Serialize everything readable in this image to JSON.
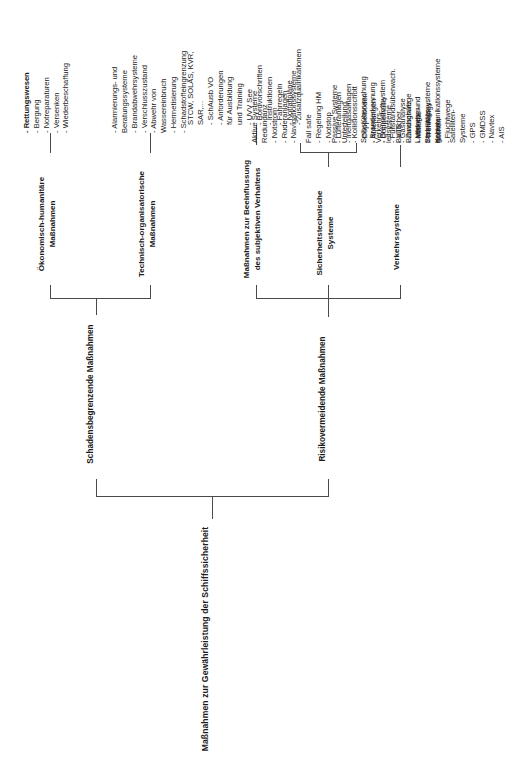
{
  "diagram": {
    "title": "Maßnahmen zur Gewährleistung der Schiffssicherheit",
    "branches": [
      {
        "id": "risiko",
        "label": "Risikovermeidende Maßnahmen"
      },
      {
        "id": "schaden",
        "label": "Schadensbegrenzende Maßnahmen"
      }
    ],
    "categories": [
      {
        "id": "verkehrssysteme",
        "label": "Verkehrssysteme"
      },
      {
        "id": "sicherheitstechnik",
        "label": "Sicherheitstechnische\nSysteme"
      },
      {
        "id": "verhalten",
        "label": "Maßnahmen zur Beeinflussung\ndes subjektiven Verhaltens"
      },
      {
        "id": "techorg",
        "label": "Technisch-organisatorische\nMaßnahmen"
      },
      {
        "id": "oekonomisch",
        "label": "Ökonomisch-humanitäre\nMaßnahmen"
      }
    ],
    "columns": [
      {
        "id": "col-verkehrssysteme",
        "groups": [
          {
            "heading": "Verkehrs-\nleitsysteme",
            "items": [
              "- VTS",
              "- Zwangswege",
              "- Verkehrs-\n  trennungs-\n  gebiete"
            ]
          },
          {
            "heading": "Satelliten-\nSysteme",
            "items": [
              "- GPS",
              "- GMDSS",
              "- Navtex",
              "- AIS"
            ]
          }
        ]
      },
      {
        "id": "col-sicherheitstechnik-passiv",
        "groups": [
          {
            "heading": "Passive Systeme\nUnterteilung",
            "items": [
              "- Kollisionsschott",
              "- Doppelboden",
              "- Abteilungen",
              "- Doppelhülle"
            ]
          },
          {
            "heading": "Baulicher\nBrandschutz",
            "items": [
              "- Material",
              "- Trennungs-\n  flächen",
              "- Fluchtwege"
            ]
          }
        ]
      },
      {
        "id": "col-sicherheitstechnik-aktiv",
        "groups": [
          {
            "heading": "Aktive Systeme\nRedundanz",
            "items": [
              "- Notstrom",
              "- Ruderanlagen",
              "- Navigationssysteme"
            ]
          },
          {
            "heading": "Fail safe",
            "items": [
              "- Regelung HM",
              "- Notstop",
              "- Lüfteranlagen",
              "- Inertgasanlagen"
            ]
          },
          {
            "heading": "Selbstüberwachung",
            "items": [
              "- Branderkennung",
              "- Brennstoffsystem",
              "- Füllstandsüberwach.",
              "- Gasanalyse"
            ]
          },
          {
            "heading": "Ladungs- und\nStabilitätssysteme\nKommunikationssysteme",
            "items": []
          }
        ]
      },
      {
        "id": "col-verhalten",
        "groups": [
          {
            "heading": "STCW, SOLAS, KVR,\nSAR,...",
            "items": [
              "- SchAusb VO",
              "- Anforderungen\n  für Ausbildung\n  und Training",
              "- UVV See",
              "- Bordvorschriften",
              "- Instruktionen",
              "- Fahrregeln",
              "- Notfallpläne",
              "- Zusatzqualifikationen"
            ]
          }
        ]
      },
      {
        "id": "col-techorg",
        "groups": [
          {
            "heading": "",
            "items": [
              "- Alarmierungs- und\n  Beratungssysteme",
              "- Brandabwehrsysteme",
              "- Verschlusszustand",
              "- Abwehr von\n  Wassereinbruch",
              "- Hermetisierung",
              "- Schadstoffeingrenzung"
            ]
          }
        ]
      },
      {
        "id": "col-oekonomisch",
        "groups": [
          {
            "heading": "",
            "items": [
              "- Rettungswesen",
              "- Bergung",
              "- Notreparaturen",
              "- Versenken",
              "- Wiederbeschaffung"
            ]
          }
        ]
      }
    ]
  }
}
